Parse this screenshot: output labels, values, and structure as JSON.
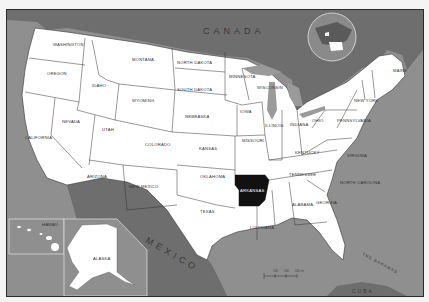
{
  "map": {
    "title": "United States — Arkansas highlighted",
    "highlighted_state": "ARKANSAS",
    "colors": {
      "ocean": "#8f8f8f",
      "foreign_land": "#6e6e6e",
      "us_land": "#ffffff",
      "highlight": "#111111",
      "border": "#333333",
      "lakes": "#9a9a9a"
    },
    "countries": {
      "canada": "CANADA",
      "mexico": "MEXICO",
      "bahamas": "THE BAHAMAS",
      "cuba": "CUBA"
    },
    "states": {
      "washington": "WASHINGTON",
      "oregon": "OREGON",
      "california": "CALIFORNIA",
      "nevada": "NEVADA",
      "idaho": "IDAHO",
      "montana": "MONTANA",
      "wyoming": "WYOMING",
      "utah": "UTAH",
      "colorado": "COLORADO",
      "arizona": "ARIZONA",
      "new_mexico": "NEW MEXICO",
      "north_dakota": "NORTH DAKOTA",
      "south_dakota": "SOUTH DAKOTA",
      "nebraska": "NEBRASKA",
      "kansas": "KANSAS",
      "oklahoma": "OKLAHOMA",
      "texas": "TEXAS",
      "minnesota": "MINNESOTA",
      "iowa": "IOWA",
      "missouri": "MISSOURI",
      "arkansas": "ARKANSAS",
      "louisiana": "LOUISIANA",
      "wisconsin": "WISCONSIN",
      "illinois": "ILLINOIS",
      "michigan": "MICHIGAN",
      "indiana": "INDIANA",
      "ohio": "OHIO",
      "kentucky": "KENTUCKY",
      "tennessee": "TENNESSEE",
      "mississippi": "MISSISSIPPI",
      "alabama": "ALABAMA",
      "georgia": "GEORGIA",
      "florida": "FLORIDA",
      "south_carolina": "SOUTH CAROLINA",
      "north_carolina": "NORTH CAROLINA",
      "virginia": "VIRGINIA",
      "west_virginia": "WEST VIRGINIA",
      "pennsylvania": "PENNSYLVANIA",
      "new_york": "NEW YORK",
      "maine": "MAINE",
      "alaska": "ALASKA",
      "hawaii": "HAWAII"
    },
    "capitals": {
      "olympia": "Olympia",
      "salem": "Salem",
      "boise": "Boise",
      "helena": "Helena",
      "bismarck": "Bismarck",
      "pierre": "Pierre",
      "cheyenne": "Cheyenne",
      "lincoln": "Lincoln",
      "topeka": "Topeka",
      "denver": "Denver",
      "salt_lake_city": "Salt Lake City",
      "carson_city": "Carson City",
      "sacramento": "Sacramento",
      "phoenix": "Phoenix",
      "santa_fe": "Santa Fe",
      "oklahoma_city": "Oklahoma City",
      "austin": "Austin",
      "baton_rouge": "Baton Rouge",
      "jackson": "Jackson",
      "montgomery": "Montgomery",
      "atlanta": "Atlanta",
      "tallahassee": "Tallahassee",
      "columbia": "Columbia",
      "raleigh": "Raleigh",
      "nashville": "Nashville",
      "frankfort": "Frankfort",
      "richmond": "Richmond",
      "charleston": "Charleston",
      "columbus": "Columbus",
      "indianapolis": "Indianapolis",
      "springfield": "Springfield",
      "jefferson_city": "Jefferson City",
      "des_moines": "Des Moines",
      "st_paul": "St. Paul",
      "madison": "Madison",
      "lansing": "Lansing",
      "harrisburg": "Harrisburg",
      "albany": "Albany",
      "augusta": "Augusta",
      "juneau": "Juneau",
      "honolulu": "Honolulu"
    },
    "scale_bar": {
      "ticks": [
        "0",
        "100",
        "200",
        "300 mi"
      ]
    }
  }
}
